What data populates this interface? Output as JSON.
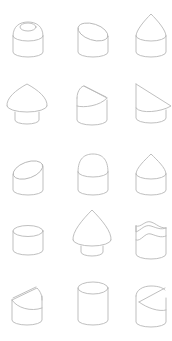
{
  "figure": {
    "grid": {
      "rows": 5,
      "columns": 3
    },
    "stroke_color": "#b8b8b8",
    "background": "#ffffff",
    "shapes": [
      {
        "row": 1,
        "col": 1,
        "type": "cylinder-rounded-top-with-boss"
      },
      {
        "row": 1,
        "col": 2,
        "type": "cylinder-slanted-cut-top"
      },
      {
        "row": 1,
        "col": 3,
        "type": "cylinder-conical-top"
      },
      {
        "row": 2,
        "col": 1,
        "type": "cylinder-wide-cone-cap"
      },
      {
        "row": 2,
        "col": 2,
        "type": "cylinder-wedge-cut-top"
      },
      {
        "row": 2,
        "col": 3,
        "type": "cylinder-large-slanted-cap"
      },
      {
        "row": 3,
        "col": 1,
        "type": "cylinder-slanted-cut-top"
      },
      {
        "row": 3,
        "col": 2,
        "type": "cylinder-dome-top"
      },
      {
        "row": 3,
        "col": 3,
        "type": "cylinder-conical-top"
      },
      {
        "row": 4,
        "col": 1,
        "type": "short-cylinder-flat-top"
      },
      {
        "row": 4,
        "col": 2,
        "type": "cylinder-tall-cone-cap"
      },
      {
        "row": 4,
        "col": 3,
        "type": "cylinder-wavy-top"
      },
      {
        "row": 5,
        "col": 1,
        "type": "cylinder-wedge-cut-top"
      },
      {
        "row": 5,
        "col": 2,
        "type": "tall-cylinder-flat-top"
      },
      {
        "row": 5,
        "col": 3,
        "type": "cylinder-wedge-cut-top"
      }
    ]
  }
}
